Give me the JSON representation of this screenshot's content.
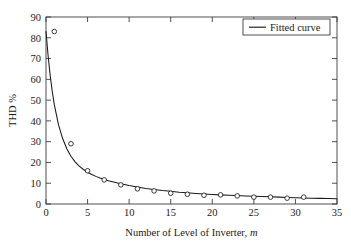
{
  "chart_data": {
    "type": "line",
    "title": "",
    "subtitle": "",
    "xlabel": "Number of Level of Inverter, m",
    "xlabel_plain": "Number of Level of Inverter,",
    "xlabel_italic": "m",
    "ylabel": "THD %",
    "xlim": [
      0,
      35
    ],
    "ylim": [
      0,
      90
    ],
    "xticks": [
      0,
      5,
      10,
      15,
      20,
      25,
      30,
      35
    ],
    "yticks": [
      0,
      10,
      20,
      30,
      40,
      50,
      60,
      70,
      80,
      90
    ],
    "xtick_labels": [
      "0",
      "5",
      "10",
      "15",
      "20",
      "25",
      "30",
      "35"
    ],
    "ytick_labels": [
      "0",
      "10",
      "20",
      "30",
      "40",
      "50",
      "60",
      "70",
      "80",
      "90"
    ],
    "grid": false,
    "legend_position": "top-right",
    "legend": [
      {
        "label": "Fitted curve",
        "style": "solid-line",
        "color": "#1a1a1a"
      }
    ],
    "series": [
      {
        "name": "Fitted curve",
        "style": "line",
        "color": "#1a1a1a",
        "x": [
          0,
          0.25,
          0.5,
          0.75,
          1,
          1.5,
          2,
          2.5,
          3,
          3.5,
          4,
          4.5,
          5,
          5.5,
          6,
          6.5,
          7,
          7.5,
          8,
          9,
          10,
          11,
          12,
          13,
          14,
          15,
          16,
          17,
          18,
          19,
          20,
          21,
          22,
          23,
          24,
          25,
          26,
          27,
          28,
          29,
          30,
          31,
          32,
          33,
          34,
          35
        ],
        "values": [
          83.0,
          71.5,
          62.0,
          54.2,
          47.8,
          38.2,
          31.5,
          26.6,
          23.0,
          20.3,
          18.2,
          16.6,
          15.3,
          14.2,
          13.3,
          12.5,
          11.8,
          11.2,
          10.7,
          9.7,
          8.9,
          8.2,
          7.5,
          7.0,
          6.5,
          6.1,
          5.7,
          5.4,
          5.1,
          4.85,
          4.6,
          4.4,
          4.2,
          4.05,
          3.9,
          3.75,
          3.6,
          3.45,
          3.3,
          3.15,
          3.0,
          2.9,
          2.8,
          2.7,
          2.6,
          2.5
        ]
      },
      {
        "name": "Data points",
        "style": "markers",
        "marker": "open-circle",
        "color": "#1a1a1a",
        "x": [
          1,
          3,
          5,
          7,
          9,
          11,
          13,
          15,
          17,
          19,
          21,
          23,
          25,
          27,
          29,
          31
        ],
        "values": [
          83.0,
          29.0,
          16.0,
          11.6,
          9.2,
          7.3,
          6.3,
          5.2,
          4.7,
          4.2,
          4.4,
          3.9,
          3.3,
          3.3,
          2.8,
          3.3
        ]
      }
    ]
  },
  "figure": {
    "background_color": "#ffffff",
    "axis_color": "#3d3d3d",
    "line_color": "#1a1a1a"
  }
}
